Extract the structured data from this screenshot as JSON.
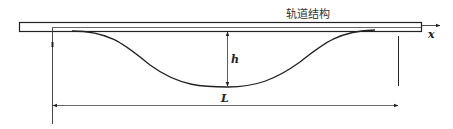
{
  "diagram": {
    "title": "轨道结构",
    "labels": {
      "height": "h",
      "length": "L",
      "axis": "x"
    },
    "colors": {
      "stroke": "#222222",
      "background": "#ffffff"
    }
  }
}
